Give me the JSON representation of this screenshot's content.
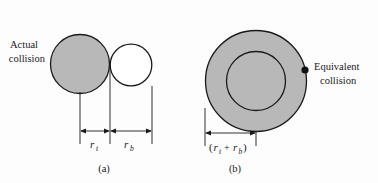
{
  "figure": {
    "background_color": "#fdfdfd",
    "stroke_color": "#1a1a1a",
    "fill_gray": "#b8b8b8",
    "panels": [
      {
        "id": "a",
        "caption": "(a)",
        "annotation": {
          "line1": "Actual",
          "line2": "collision"
        },
        "shapes": [
          {
            "name": "target-circle-filled",
            "cx": 80,
            "cy": 64,
            "r": 30,
            "fill": "#b8b8b8"
          },
          {
            "name": "bullet-circle-open",
            "cx": 131,
            "cy": 65,
            "r": 21,
            "fill": "#ffffff"
          }
        ],
        "dimensions": [
          {
            "name": "r-t",
            "symbol": "r",
            "subscript": "t",
            "from_x": 80,
            "to_x": 110,
            "y": 131
          },
          {
            "name": "r-b",
            "symbol": "r",
            "subscript": "b",
            "from_x": 110,
            "to_x": 152,
            "y": 131
          }
        ]
      },
      {
        "id": "b",
        "caption": "(b)",
        "annotation": {
          "line1": "Equivalent",
          "line2": "collision"
        },
        "shapes": [
          {
            "name": "equivalent-circle-outer",
            "cx": 256,
            "cy": 81,
            "r": 51,
            "fill": "#b8b8b8"
          },
          {
            "name": "equivalent-circle-inner",
            "cx": 256,
            "cy": 81,
            "r": 30,
            "fill": "#b8b8b8"
          },
          {
            "name": "collision-point-dot",
            "cx": 305,
            "cy": 70,
            "r": 3.6,
            "fill": "#111111"
          }
        ],
        "dimensions": [
          {
            "name": "r-t-plus-r-b",
            "expression_parts": {
              "open_paren": "(",
              "symbol1": "r",
              "subscript1": "t",
              "operator": "+",
              "symbol2": "r",
              "subscript2": "b",
              "close_paren": ")"
            },
            "from_x": 205,
            "to_x": 256,
            "y": 133
          }
        ]
      }
    ]
  }
}
